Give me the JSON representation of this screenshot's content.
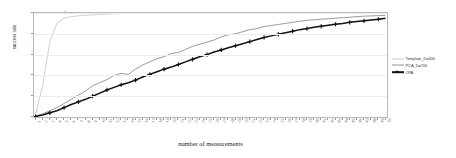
{
  "chart_data": {
    "type": "line",
    "title": "",
    "xlabel": "number of measurements",
    "ylabel": "success rate",
    "xlim": [
      0,
      50
    ],
    "ylim": [
      0,
      1
    ],
    "grid": true,
    "legend_position": "right-outside",
    "yticks": [
      "0",
      "0.2",
      "0.4",
      "0.6",
      "0.8",
      "1"
    ],
    "ytick_values": [
      0,
      0.2,
      0.4,
      0.6,
      0.8,
      1
    ],
    "x": [
      1,
      2,
      3,
      4,
      5,
      6,
      7,
      8,
      9,
      10,
      11,
      12,
      13,
      14,
      15,
      16,
      17,
      18,
      19,
      20,
      21,
      22,
      23,
      24,
      25,
      26,
      27,
      28,
      29,
      30,
      31,
      32,
      33,
      34,
      35,
      36,
      37,
      38,
      39,
      40,
      41,
      42,
      43,
      44,
      45,
      46,
      47,
      48,
      49,
      50
    ],
    "xtick_labels": [
      "1",
      "2",
      "3",
      "4",
      "5",
      "6",
      "7",
      "8",
      "9",
      "10",
      "11",
      "12",
      "13",
      "14",
      "15",
      "16",
      "17",
      "18",
      "19",
      "20",
      "21",
      "22",
      "23",
      "24",
      "25",
      "26",
      "27",
      "28",
      "29",
      "30",
      "31",
      "32",
      "33",
      "34",
      "35",
      "36",
      "37",
      "38",
      "39",
      "40",
      "41",
      "42",
      "43",
      "44",
      "45",
      "46",
      "47",
      "48",
      "49",
      "50"
    ],
    "series": [
      {
        "name": "Template_D=300",
        "color": "#c8c8c8",
        "marker": "none",
        "values": [
          0.02,
          0.3,
          0.72,
          0.9,
          0.95,
          0.965,
          0.972,
          0.978,
          0.982,
          0.986,
          0.99,
          0.993,
          0.995,
          0.996,
          0.997,
          0.998,
          0.998,
          0.999,
          0.999,
          1.0,
          1.0,
          1.0,
          1.0,
          1.0,
          1.0,
          1.0,
          1.0,
          1.0,
          1.0,
          1.0,
          1.0,
          1.0,
          1.0,
          1.0,
          1.0,
          1.0,
          1.0,
          1.0,
          1.0,
          1.0,
          1.0,
          1.0,
          1.0,
          1.0,
          1.0,
          1.0,
          1.0,
          1.0,
          1.0,
          1.0
        ]
      },
      {
        "name": "PCA_D=700",
        "color": "#8f8f8f",
        "marker": "none",
        "values": [
          0.01,
          0.03,
          0.06,
          0.09,
          0.13,
          0.17,
          0.21,
          0.25,
          0.3,
          0.33,
          0.36,
          0.4,
          0.42,
          0.41,
          0.46,
          0.5,
          0.53,
          0.56,
          0.58,
          0.61,
          0.62,
          0.65,
          0.68,
          0.7,
          0.72,
          0.74,
          0.77,
          0.79,
          0.8,
          0.82,
          0.84,
          0.85,
          0.87,
          0.88,
          0.89,
          0.9,
          0.91,
          0.92,
          0.93,
          0.935,
          0.94,
          0.945,
          0.95,
          0.955,
          0.96,
          0.965,
          0.97,
          0.972,
          0.975,
          0.978
        ]
      },
      {
        "name": "CPA",
        "color": "#111111",
        "marker": "plus",
        "values": [
          0.005,
          0.02,
          0.04,
          0.06,
          0.09,
          0.12,
          0.145,
          0.17,
          0.2,
          0.23,
          0.26,
          0.285,
          0.31,
          0.33,
          0.355,
          0.385,
          0.41,
          0.435,
          0.46,
          0.48,
          0.505,
          0.53,
          0.555,
          0.58,
          0.6,
          0.625,
          0.645,
          0.665,
          0.685,
          0.705,
          0.725,
          0.745,
          0.765,
          0.78,
          0.795,
          0.81,
          0.825,
          0.84,
          0.85,
          0.862,
          0.872,
          0.882,
          0.892,
          0.9,
          0.91,
          0.918,
          0.925,
          0.932,
          0.94,
          0.95
        ]
      }
    ]
  }
}
